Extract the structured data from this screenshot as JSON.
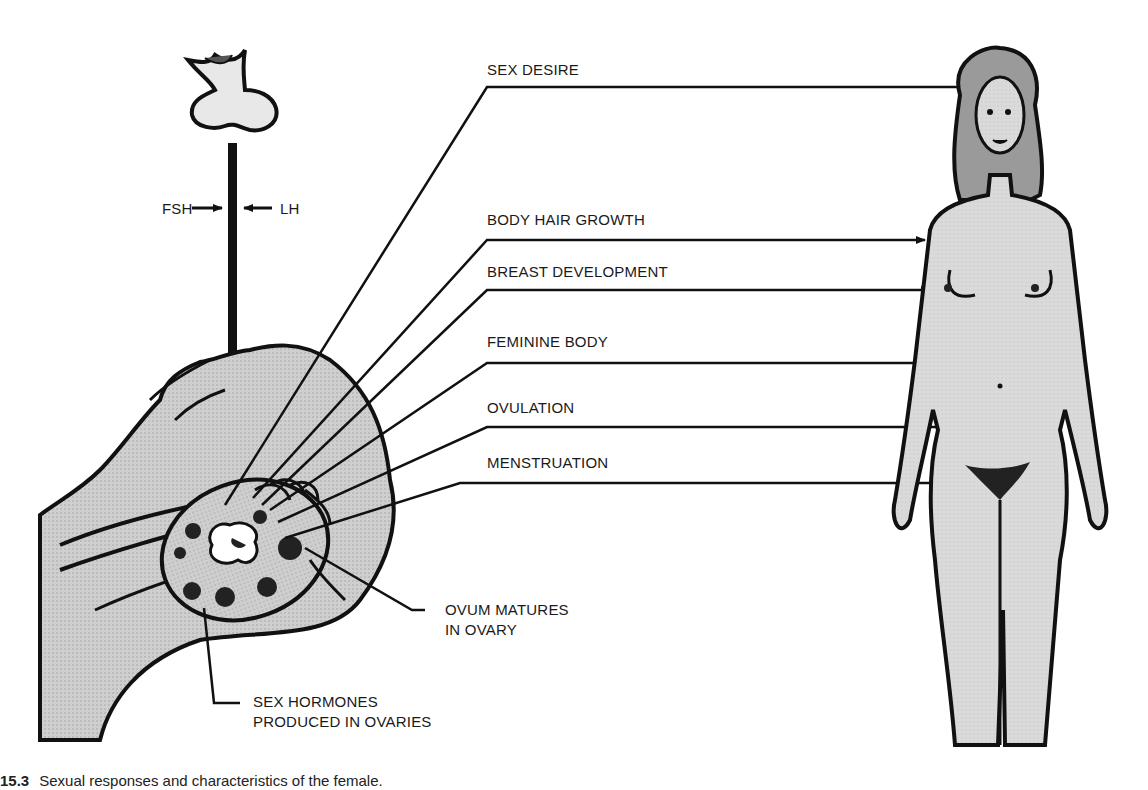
{
  "diagram": {
    "pituitary_hormones": {
      "left": "FSH",
      "right": "LH"
    },
    "effects": [
      {
        "label": "SEX DESIRE"
      },
      {
        "label": "BODY HAIR GROWTH"
      },
      {
        "label": "BREAST DEVELOPMENT"
      },
      {
        "label": "FEMININE BODY"
      },
      {
        "label": "OVULATION"
      },
      {
        "label": "MENSTRUATION"
      }
    ],
    "callouts": {
      "ovum": [
        "OVUM MATURES",
        "IN OVARY"
      ],
      "hormones": [
        "SEX HORMONES",
        "PRODUCED IN OVARIES"
      ]
    },
    "caption": {
      "number": "15.3",
      "text": "Sexual responses and characteristics of the female."
    },
    "colors": {
      "ink": "#111111",
      "fill": "#c9c9c9",
      "body_fill": "#d9d9d9",
      "background": "#ffffff"
    }
  }
}
